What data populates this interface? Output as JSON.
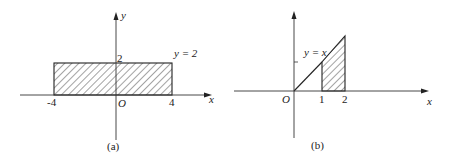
{
  "panels": [
    {
      "id": "a",
      "caption": "(a)",
      "axis_x_label": "x",
      "axis_y_label": "y",
      "origin_label": "O",
      "ticks_x": [
        "-4",
        "4"
      ],
      "tick_y": "2",
      "curve_label": "y = 2",
      "shaded_region": {
        "x_from": -4,
        "x_to": 4,
        "y_from": 0,
        "y_to": 2
      }
    },
    {
      "id": "b",
      "caption": "(b)",
      "axis_x_label": "x",
      "origin_label": "O",
      "ticks_x": [
        "1",
        "2"
      ],
      "curve_label": "y = x",
      "shaded_region": {
        "x_from": 1,
        "x_to": 2,
        "y_from": 0,
        "y_to": "x"
      }
    }
  ],
  "colors": {
    "stroke": "#222222",
    "background": "#ffffff"
  }
}
